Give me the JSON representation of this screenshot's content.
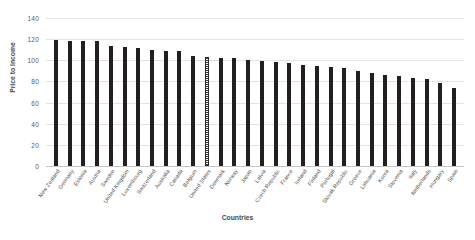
{
  "chart_data": {
    "type": "bar",
    "title": "",
    "xlabel": "Countries",
    "ylabel": "Price to Income",
    "ylim": [
      0,
      140
    ],
    "yticks": [
      0,
      20,
      40,
      60,
      80,
      100,
      120,
      140
    ],
    "grid": true,
    "legend": "none",
    "highlight_category": "United States",
    "categories": [
      "New Zealand",
      "Germany",
      "Estonia",
      "Austria",
      "Sweden",
      "United Kingdom",
      "Luxembourg",
      "Switzerland",
      "Australia",
      "Canada",
      "Belgium",
      "United States",
      "Denmark",
      "Norway",
      "Japan",
      "Latvia",
      "Czech Republic",
      "France",
      "Ireland",
      "Finland",
      "Portugal",
      "Slovak Republic",
      "Greece",
      "Lithuania",
      "Korea",
      "Slovenia",
      "Italy",
      "Netherlands",
      "Hungary",
      "Spain"
    ],
    "values": [
      119,
      118,
      118,
      118,
      114,
      113,
      112,
      110,
      109,
      109,
      104,
      103,
      102,
      102,
      100,
      99,
      98,
      97,
      96,
      95,
      94,
      93,
      90,
      88,
      86,
      85,
      83,
      82,
      79,
      74
    ]
  },
  "axes": {
    "y_title": "Price to Income",
    "x_title": "Countries",
    "y_tick_labels": [
      "140",
      "120",
      "100",
      "80",
      "60",
      "40",
      "20",
      "0"
    ]
  }
}
